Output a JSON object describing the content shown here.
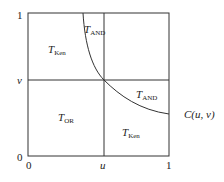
{
  "diagram": {
    "axes": {
      "x_ticks": [
        "0",
        "u",
        "1"
      ],
      "y_ticks": [
        "0",
        "v",
        "1"
      ]
    },
    "regions": [
      {
        "id": "top-left",
        "symbol": "T",
        "subscript": "Ken"
      },
      {
        "id": "top-curve",
        "symbol": "T",
        "subscript": "AND"
      },
      {
        "id": "bottom-left",
        "symbol": "T",
        "subscript": "OR"
      },
      {
        "id": "right-curve",
        "symbol": "T",
        "subscript": "AND"
      },
      {
        "id": "bottom-right",
        "symbol": "T",
        "subscript": "Ken"
      }
    ],
    "curve_label": "C(u, v)",
    "colors": {
      "line": "#333333",
      "background": "#ffffff"
    }
  }
}
